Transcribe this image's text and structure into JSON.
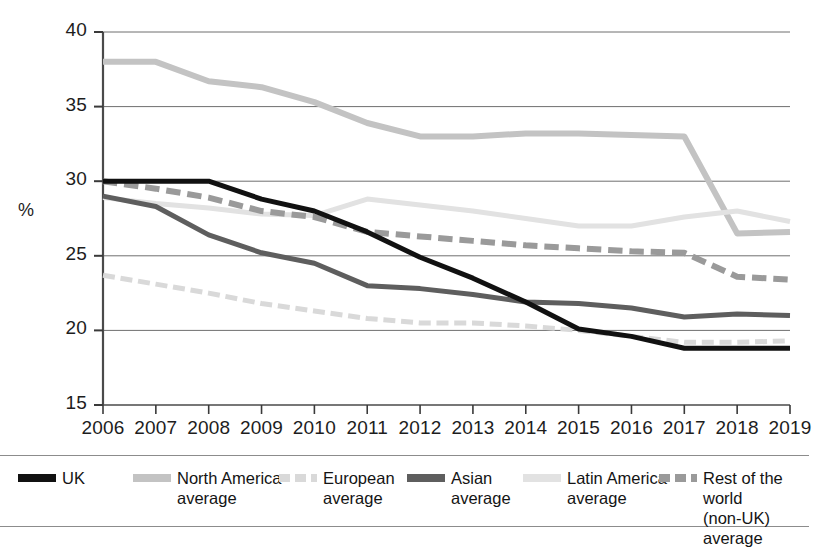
{
  "axes": {
    "y_title": "%",
    "y_ticks": [
      "40",
      "35",
      "30",
      "25",
      "20",
      "15"
    ],
    "x_ticks": [
      "2006",
      "2007",
      "2008",
      "2009",
      "2010",
      "2011",
      "2012",
      "2013",
      "2014",
      "2015",
      "2016",
      "2017",
      "2018",
      "2019"
    ]
  },
  "legend": {
    "items": [
      {
        "label": "UK",
        "color": "#111111",
        "style": "solid"
      },
      {
        "label": "North America\naverage",
        "color": "#c3c3c3",
        "style": "solid"
      },
      {
        "label": "European\naverage",
        "color": "#d9d9d9",
        "style": "dashed"
      },
      {
        "label": "Asian\naverage",
        "color": "#5e5e5e",
        "style": "solid"
      },
      {
        "label": "Latin America\naverage",
        "color": "#e2e2e2",
        "style": "solid"
      },
      {
        "label": "Rest of the world\n(non-UK) average",
        "color": "#9a9a9a",
        "style": "dashed"
      }
    ]
  },
  "chart_data": {
    "type": "line",
    "title": "",
    "xlabel": "",
    "ylabel": "%",
    "ylim": [
      15,
      40
    ],
    "yticks": [
      15,
      20,
      25,
      30,
      35,
      40
    ],
    "grid": true,
    "legend_position": "bottom",
    "x": [
      "2006",
      "2007",
      "2008",
      "2009",
      "2010",
      "2011",
      "2012",
      "2013",
      "2014",
      "2015",
      "2016",
      "2017",
      "2018",
      "2019"
    ],
    "series": [
      {
        "name": "UK",
        "color": "#111111",
        "style": "solid",
        "width": 5,
        "values": [
          30.0,
          30.0,
          30.0,
          28.8,
          28.0,
          26.6,
          24.9,
          23.5,
          21.9,
          20.1,
          19.6,
          18.8,
          18.8,
          18.8
        ]
      },
      {
        "name": "North America average",
        "color": "#c3c3c3",
        "style": "solid",
        "width": 6,
        "values": [
          38.0,
          38.0,
          36.7,
          36.3,
          35.3,
          33.9,
          33.0,
          33.0,
          33.2,
          33.2,
          33.1,
          33.0,
          26.5,
          26.6
        ]
      },
      {
        "name": "European average",
        "color": "#d9d9d9",
        "style": "dashed",
        "width": 5,
        "values": [
          23.7,
          23.1,
          22.5,
          21.8,
          21.3,
          20.8,
          20.5,
          20.5,
          20.3,
          20.0,
          19.6,
          19.2,
          19.2,
          19.3
        ]
      },
      {
        "name": "Asian average",
        "color": "#5e5e5e",
        "style": "solid",
        "width": 5,
        "values": [
          29.0,
          28.3,
          26.4,
          25.2,
          24.5,
          23.0,
          22.8,
          22.4,
          21.9,
          21.8,
          21.5,
          20.9,
          21.1,
          21.0
        ]
      },
      {
        "name": "Latin America average",
        "color": "#e2e2e2",
        "style": "solid",
        "width": 5,
        "values": [
          28.9,
          28.5,
          28.2,
          27.8,
          27.7,
          28.8,
          28.4,
          28.0,
          27.5,
          27.0,
          27.0,
          27.6,
          28.0,
          27.3
        ]
      },
      {
        "name": "Rest of the world (non-UK) average",
        "color": "#9a9a9a",
        "style": "dashed",
        "width": 6,
        "values": [
          30.0,
          29.5,
          28.9,
          28.0,
          27.6,
          26.6,
          26.3,
          26.0,
          25.7,
          25.5,
          25.3,
          25.2,
          23.6,
          23.4
        ]
      }
    ]
  }
}
